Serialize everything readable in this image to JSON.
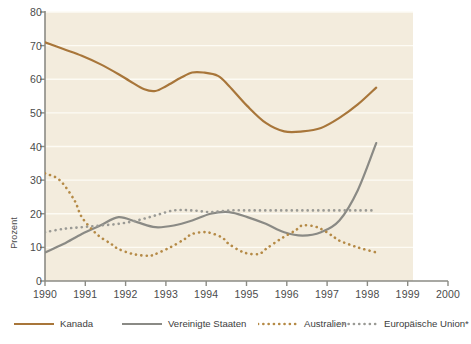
{
  "chart_data": {
    "type": "line",
    "title": "",
    "subtitle": "",
    "xlabel": "",
    "ylabel": "Prozent",
    "xlim": [
      1990,
      2000
    ],
    "ylim": [
      0,
      80
    ],
    "grid": true,
    "grid_orientation": "horizontal",
    "legend_position": "bottom",
    "background_color": "#f3ecdd",
    "gridline_color": "#fdfbf4",
    "axis_color": "#8b8b85",
    "xticks": [
      1990,
      1991,
      1992,
      1993,
      1994,
      1995,
      1996,
      1997,
      1998,
      1999,
      2000
    ],
    "xtick_labels": [
      "1990",
      "1991",
      "1992",
      "1993",
      "1994",
      "1995",
      "1996",
      "1997",
      "1998",
      "1999",
      "2000"
    ],
    "yticks": [
      0,
      10,
      20,
      30,
      40,
      50,
      60,
      70,
      80
    ],
    "ytick_labels": [
      "0",
      "10",
      "20",
      "30",
      "40",
      "50",
      "60",
      "70",
      "80"
    ],
    "series": [
      {
        "name": "Kanada",
        "color": "#a8763a",
        "style": "solid",
        "x": [
          1990,
          1990.5,
          1991,
          1991.5,
          1992,
          1992.3,
          1992.7,
          1993,
          1993.3,
          1993.7,
          1994,
          1994.3,
          1994.7,
          1995,
          1995.5,
          1996,
          1996.5,
          1997,
          1997.5,
          1998,
          1998.5,
          1999
        ],
        "values": [
          71,
          69,
          67,
          64.5,
          61.5,
          59.5,
          57,
          56.5,
          58,
          60.5,
          62,
          62,
          61,
          58,
          52,
          47,
          44.5,
          44.5,
          45.5,
          48.5,
          52.5,
          57.5
        ]
      },
      {
        "name": "Vereinigte Staaten",
        "color": "#8a8a85",
        "style": "solid",
        "x": [
          1990,
          1990.5,
          1991,
          1991.5,
          1992,
          1992.5,
          1993,
          1993.5,
          1994,
          1994.5,
          1995,
          1995.5,
          1996,
          1996.5,
          1997,
          1997.5,
          1998,
          1998.5,
          1999
        ],
        "values": [
          8.5,
          11,
          14,
          16.5,
          19,
          17.5,
          16,
          16.5,
          18,
          20,
          20.5,
          19,
          17,
          14.5,
          13.5,
          14.5,
          18,
          27,
          41
        ]
      },
      {
        "name": "Australien",
        "color": "#b58a46",
        "style": "dotted",
        "x": [
          1990,
          1990.4,
          1990.8,
          1991,
          1991.4,
          1991.8,
          1992,
          1992.4,
          1992.8,
          1993,
          1993.4,
          1993.8,
          1994,
          1994.4,
          1994.8,
          1995,
          1995.4,
          1995.8,
          1996,
          1996.4,
          1996.8,
          1997,
          1997.4,
          1997.8,
          1998,
          1998.5,
          1999
        ],
        "values": [
          32,
          30,
          24,
          19,
          14,
          11,
          9.5,
          8,
          7.5,
          8,
          10,
          12.5,
          14,
          14.5,
          13,
          11,
          8.5,
          8,
          9.5,
          12.5,
          15,
          16.5,
          16,
          13.5,
          12,
          10,
          8.5
        ]
      },
      {
        "name": "Europäische Union*",
        "color": "#9a9a95",
        "style": "dotted",
        "x": [
          1990,
          1990.5,
          1991,
          1991.5,
          1992,
          1992.5,
          1993,
          1993.5,
          1994,
          1994.5,
          1995,
          1995.5,
          1996,
          1996.5,
          1997,
          1997.5,
          1998,
          1998.5,
          1999
        ],
        "values": [
          14.5,
          15.5,
          16,
          16.5,
          17,
          18,
          19.5,
          21,
          21,
          20.5,
          21,
          21,
          21,
          21,
          21,
          21,
          21,
          21,
          21
        ]
      }
    ],
    "annotations": []
  },
  "legend": {
    "items": [
      {
        "label": "Kanada",
        "color": "#a8763a",
        "style": "solid"
      },
      {
        "label": "Vereinigte Staaten",
        "color": "#8a8a85",
        "style": "solid"
      },
      {
        "label": "Australien",
        "color": "#b58a46",
        "style": "dotted"
      },
      {
        "label": "Europäische Union*",
        "color": "#9a9a95",
        "style": "dotted"
      }
    ]
  },
  "axes": {
    "y_axis_title": "Prozent"
  }
}
